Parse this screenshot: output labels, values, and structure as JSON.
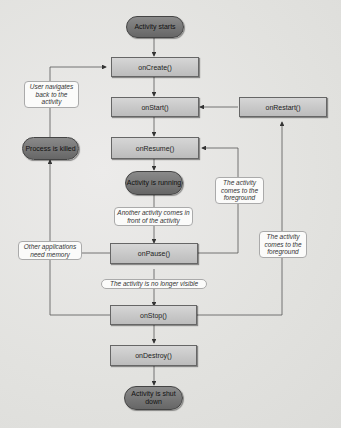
{
  "diagram": {
    "states": {
      "activity_starts": "Activity starts",
      "process_killed": "Process is killed",
      "activity_running": "Activity is running",
      "activity_shut_down": "Activity is shut down"
    },
    "methods": {
      "on_create": "onCreate()",
      "on_start": "onStart()",
      "on_restart": "onRestart()",
      "on_resume": "onResume()",
      "on_pause": "onPause()",
      "on_stop": "onStop()",
      "on_destroy": "onDestroy()"
    },
    "transitions": {
      "user_navigates_back": "User navigates back to the activity",
      "comes_to_foreground_resume": "The activity comes to the foreground",
      "another_activity_front": "Another activity comes in front of the activity",
      "other_apps_need_memory": "Other applications need memory",
      "comes_to_foreground_restart": "The activity comes to the foreground",
      "no_longer_visible": "The activity is no longer visible"
    },
    "colors": {
      "background": "#e6e6e4",
      "method_box": "#c8c8c8",
      "state_pill": "#777777",
      "line": "#555555",
      "label_bg": "#fbfbfa"
    }
  }
}
